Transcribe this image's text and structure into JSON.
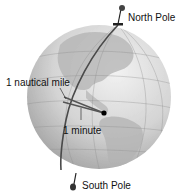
{
  "diagram": {
    "labels": {
      "north_pole": "North Pole",
      "nautical_mile": "1 nautical mile",
      "minute": "1 minute",
      "south_pole": "South Pole"
    },
    "colors": {
      "background": "#ffffff",
      "globe_light": "#e6e6e6",
      "globe_mid": "#c4c4c4",
      "globe_dark": "#9a9a9a",
      "land": "#b0b0b0",
      "meridian_line": "#4a4a4a",
      "pointer_line": "#555555",
      "center_dot": "#000000",
      "text": "#111111"
    }
  }
}
